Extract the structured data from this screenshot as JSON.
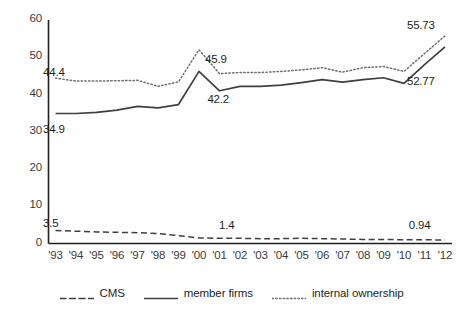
{
  "chart_data": {
    "type": "line",
    "title": "",
    "xlabel": "",
    "ylabel": "",
    "ylim": [
      0,
      60
    ],
    "yticks": [
      0,
      10,
      20,
      30,
      40,
      50,
      60
    ],
    "grid": false,
    "legend_position": "bottom",
    "categories": [
      "'93",
      "'94",
      "'95",
      "'96",
      "'97",
      "'98",
      "'99",
      "'00",
      "'01",
      "'02",
      "'03",
      "'04",
      "'05",
      "'06",
      "'07",
      "'08",
      "'09",
      "'10",
      "'11",
      "'12"
    ],
    "series": [
      {
        "name": "CMS",
        "style": "dashed",
        "color": "#3f3f3f",
        "values": [
          3.5,
          3.3,
          3.1,
          3.0,
          2.9,
          2.7,
          2.1,
          1.5,
          1.4,
          1.4,
          1.3,
          1.3,
          1.4,
          1.3,
          1.2,
          1.1,
          1.1,
          1.0,
          1.0,
          0.94
        ]
      },
      {
        "name": "member firms",
        "style": "solid",
        "color": "#3f3f3f",
        "values": [
          34.9,
          34.9,
          35.2,
          35.8,
          36.8,
          36.4,
          37.3,
          46.2,
          41.0,
          42.2,
          42.2,
          42.5,
          43.2,
          44.0,
          43.3,
          44.0,
          44.5,
          43.0,
          48.0,
          52.77
        ]
      },
      {
        "name": "internal ownership",
        "style": "dotted",
        "color": "#6e6e6e",
        "values": [
          44.4,
          43.6,
          43.6,
          43.7,
          43.8,
          42.2,
          43.4,
          52.0,
          45.6,
          45.9,
          45.9,
          46.2,
          46.6,
          47.2,
          46.0,
          47.2,
          47.5,
          46.2,
          51.0,
          55.73
        ]
      }
    ],
    "annotations": [
      {
        "text": "44.4",
        "x_pct": 9.3,
        "y_pct": 20.8,
        "series": "internal ownership"
      },
      {
        "text": "34.9",
        "x_pct": 9.3,
        "y_pct": 38.8,
        "series": "member firms"
      },
      {
        "text": "3.5",
        "x_pct": 9.3,
        "y_pct": 68.4,
        "series": "CMS"
      },
      {
        "text": "45.9",
        "x_pct": 44.3,
        "y_pct": 16.7,
        "series": "internal ownership"
      },
      {
        "text": "42.2",
        "x_pct": 44.8,
        "y_pct": 29.3,
        "series": "member firms"
      },
      {
        "text": "1.4",
        "x_pct": 47.3,
        "y_pct": 69.1,
        "series": "CMS"
      },
      {
        "text": "55.73",
        "x_pct": 87.9,
        "y_pct": 6.0,
        "series": "internal ownership"
      },
      {
        "text": "52.77",
        "x_pct": 87.9,
        "y_pct": 23.7,
        "series": "member firms"
      },
      {
        "text": "0.94",
        "x_pct": 88.3,
        "y_pct": 69.1,
        "series": "CMS"
      }
    ]
  },
  "legend": {
    "items": [
      {
        "label": "CMS",
        "swatch": "dashed-line-swatch"
      },
      {
        "label": "member firms",
        "swatch": "solid-line-swatch"
      },
      {
        "label": "internal ownership",
        "swatch": "dotted-line-swatch"
      }
    ]
  },
  "axes": {
    "y_tick_labels": [
      "60",
      "50",
      "40",
      "30",
      "20",
      "10",
      "0"
    ],
    "x_tick_labels": [
      "'93",
      "'94",
      "'95",
      "'96",
      "'97",
      "'98",
      "'99",
      "'00",
      "'01",
      "'02",
      "'03",
      "'04",
      "'05",
      "'06",
      "'07",
      "'08",
      "'09",
      "'10",
      "'11",
      "'12"
    ]
  },
  "colors": {
    "axis": "#231f20",
    "cms": "#3f3f3f",
    "member_firms": "#3f3f3f",
    "internal_ownership": "#6e6e6e",
    "background": "#ffffff"
  }
}
